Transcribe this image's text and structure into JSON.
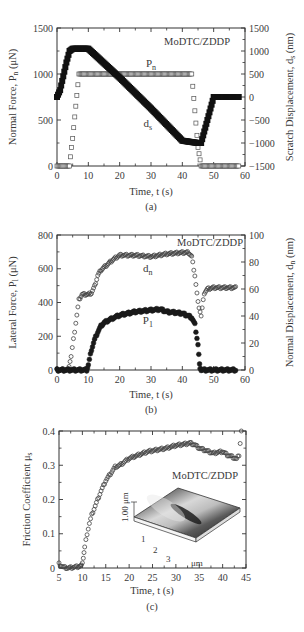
{
  "figure": {
    "panels": [
      "(a)",
      "(b)",
      "(c)"
    ]
  },
  "chart_data": [
    {
      "id": "a",
      "type": "line",
      "panel_label": "(a)",
      "annotation": "MoDTC/ZDDP",
      "xlabel": "Time, t (s)",
      "ylabel": "Normal Force, Pn (μN)",
      "ylabel_parts": {
        "main": "Normal Force, P",
        "sub": "n",
        "tail": " (μN)"
      },
      "y2label": "Scratch Displacement, ds (nm)",
      "y2label_parts": {
        "main": "Scratch Displacement, d",
        "sub": "s",
        "tail": " (nm)"
      },
      "xlim": [
        0,
        60
      ],
      "ylim": [
        0,
        1500
      ],
      "y2lim": [
        -1500,
        1500
      ],
      "xticks": [
        0,
        10,
        20,
        30,
        40,
        50,
        60
      ],
      "yticks": [
        0,
        500,
        1000,
        1500
      ],
      "y2ticks": [
        -1500,
        -1000,
        -500,
        0,
        500,
        1000,
        1500
      ],
      "grid": false,
      "series": [
        {
          "name": "Pn",
          "label_main": "P",
          "label_sub": "n",
          "axis": "left",
          "marker": "open-square",
          "x": [
            0,
            4,
            5,
            7,
            43,
            45,
            46,
            58
          ],
          "values": [
            0,
            0,
            300,
            1000,
            1000,
            200,
            0,
            0
          ]
        },
        {
          "name": "ds",
          "label_main": "d",
          "label_sub": "s",
          "axis": "right",
          "marker": "filled-square",
          "x": [
            0,
            1,
            2,
            3,
            4,
            5,
            10,
            20,
            30,
            40,
            45,
            46,
            48,
            50,
            58
          ],
          "values": [
            0,
            150,
            450,
            750,
            1000,
            1050,
            1050,
            420,
            -250,
            -950,
            -1000,
            -1000,
            -500,
            0,
            0
          ]
        }
      ],
      "labels_pos": {
        "Pn": [
          30,
          1080
        ],
        "ds": [
          29,
          420
        ]
      }
    },
    {
      "id": "b",
      "type": "line",
      "panel_label": "(b)",
      "annotation": "MoDTC/ZDDP",
      "xlabel": "Time, t (s)",
      "ylabel": "Lateral Force, Pl (μN)",
      "ylabel_parts": {
        "main": "Lateral Force, P",
        "sub": "l",
        "tail": " (μN)"
      },
      "y2label": "Normal Displacement, dn (nm)",
      "y2label_parts": {
        "main": "Normal Displacement, d",
        "sub": "n",
        "tail": " (nm)"
      },
      "xlim": [
        0,
        60
      ],
      "ylim": [
        0,
        800
      ],
      "y2lim": [
        0,
        100
      ],
      "xticks": [
        0,
        10,
        20,
        30,
        40,
        50,
        60
      ],
      "yticks": [
        0,
        200,
        400,
        600,
        800
      ],
      "y2ticks": [
        0,
        20,
        40,
        60,
        80,
        100
      ],
      "grid": false,
      "series": [
        {
          "name": "dn",
          "label_main": "d",
          "label_sub": "n",
          "axis": "right",
          "marker": "open-circle",
          "x": [
            0,
            3.5,
            4.5,
            6,
            7,
            8,
            9,
            10,
            11,
            12,
            13,
            14,
            16,
            18,
            20,
            25,
            30,
            35,
            40,
            42,
            43,
            44,
            45,
            46,
            47,
            48,
            50,
            55,
            57
          ],
          "values": [
            0,
            0,
            10,
            35,
            52,
            56,
            56,
            56,
            57,
            62,
            70,
            74,
            78,
            82,
            85,
            85,
            84,
            86,
            87,
            87,
            84,
            70,
            50,
            40,
            57,
            60,
            61,
            61,
            61
          ]
        },
        {
          "name": "Pl",
          "label_main": "P",
          "label_sub": "1",
          "axis": "left",
          "marker": "filled-circle",
          "x": [
            0,
            9.5,
            10,
            11,
            12,
            13,
            14,
            15,
            17,
            20,
            25,
            30,
            33,
            35,
            38,
            40,
            42,
            43,
            44,
            45,
            45.5,
            46,
            57
          ],
          "values": [
            0,
            0,
            30,
            120,
            180,
            225,
            260,
            280,
            300,
            325,
            345,
            355,
            360,
            345,
            340,
            335,
            320,
            310,
            270,
            150,
            30,
            0,
            0
          ]
        }
      ],
      "labels_pos": {
        "dn": [
          29,
          580
        ],
        "Pl": [
          29,
          270
        ]
      }
    },
    {
      "id": "c",
      "type": "scatter",
      "panel_label": "(c)",
      "annotation": "MoDTC/ZDDP",
      "xlabel": "Time, t (s)",
      "ylabel": "Friction Coefficient μs",
      "ylabel_parts": {
        "main": "Friction Coefficient μ",
        "sub": "s",
        "tail": ""
      },
      "xlim": [
        5,
        45
      ],
      "ylim": [
        0,
        0.4
      ],
      "xticks": [
        5,
        10,
        15,
        20,
        25,
        30,
        35,
        40,
        45
      ],
      "yticks": [
        0,
        0.1,
        0.2,
        0.3,
        0.4
      ],
      "grid": false,
      "series": [
        {
          "name": "mu_s",
          "axis": "left",
          "marker": "open-circle",
          "x": [
            5,
            5.5,
            6,
            7,
            8,
            9,
            9.8,
            10.2,
            10.5,
            11,
            11.5,
            12,
            13,
            14,
            15,
            16,
            17,
            18,
            19,
            20,
            22,
            24,
            26,
            28,
            30,
            32,
            33,
            34,
            35,
            36,
            37,
            38,
            39,
            40,
            41,
            42,
            43,
            43.5,
            44
          ],
          "values": [
            0.012,
            0.006,
            0.002,
            0.0,
            0.002,
            0.004,
            0.006,
            0.03,
            0.06,
            0.1,
            0.13,
            0.155,
            0.19,
            0.225,
            0.255,
            0.275,
            0.295,
            0.3,
            0.31,
            0.32,
            0.33,
            0.34,
            0.345,
            0.35,
            0.358,
            0.362,
            0.365,
            0.36,
            0.35,
            0.345,
            0.34,
            0.335,
            0.338,
            0.34,
            0.33,
            0.325,
            0.318,
            0.33,
            0.4
          ]
        }
      ],
      "inset": {
        "type": "3d-afm-topography",
        "z_label": "1.00 μm",
        "axis_ticks": [
          "1",
          "2",
          "3"
        ],
        "axis_unit": "μm"
      }
    }
  ]
}
